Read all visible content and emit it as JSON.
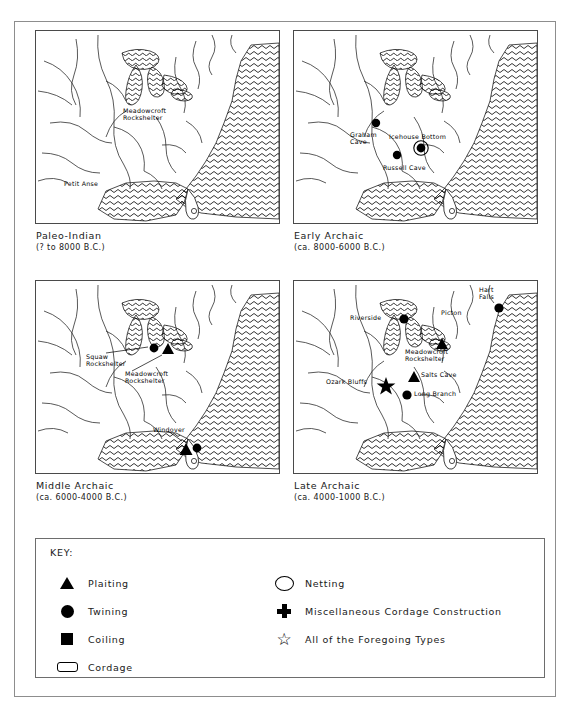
{
  "figure": {
    "panels": [
      {
        "id": "paleo-indian",
        "title": "Paleo-Indian",
        "date": "(? to 8000 B.C.)",
        "sites": [
          {
            "name": "Meadowcroft\nRockshelter",
            "symbol": "triangle",
            "label_x": 88,
            "label_y": 77,
            "marker_x": 126,
            "marker_y": 62
          },
          {
            "name": "Petit Anse",
            "symbol": "triangle",
            "label_x": 29,
            "label_y": 150,
            "marker_x": 93,
            "marker_y": 152
          }
        ]
      },
      {
        "id": "early-archaic",
        "title": "Early Archaic",
        "date": "(ca. 8000-6000 B.C.)",
        "sites": [
          {
            "name": "Graham\nCave",
            "symbol": "circle",
            "label_x": 57,
            "label_y": 101,
            "marker_x": 82,
            "marker_y": 92
          },
          {
            "name": "Icehouse Bottom",
            "symbol": "circle-in-circle",
            "label_x": 96,
            "label_y": 103,
            "marker_x": 127,
            "marker_y": 117
          },
          {
            "name": "Russell Cave",
            "symbol": "circle",
            "label_x": 90,
            "label_y": 134,
            "marker_x": 103,
            "marker_y": 124
          }
        ]
      },
      {
        "id": "middle-archaic",
        "title": "Middle Archaic",
        "date": "(ca. 6000-4000 B.C.)",
        "sites": [
          {
            "name": "Squaw\nRockshelter",
            "symbol": "circle",
            "label_x": 51,
            "label_y": 73,
            "marker_x": 118,
            "marker_y": 67
          },
          {
            "name": "Meadowcroft\nRockshelter",
            "symbol": "triangle",
            "label_x": 90,
            "label_y": 90,
            "marker_x": 132,
            "marker_y": 70
          },
          {
            "name": "Windover",
            "symbol": "triangle-circle",
            "label_x": 122,
            "label_y": 148,
            "marker_x": 155,
            "marker_y": 166
          }
        ]
      },
      {
        "id": "late-archaic",
        "title": "Late Archaic",
        "date": "(ca. 4000-1000 B.C.)",
        "sites": [
          {
            "name": "Riverside",
            "symbol": "circle",
            "label_x": 60,
            "label_y": 36,
            "marker_x": 110,
            "marker_y": 38
          },
          {
            "name": "Picton",
            "symbol": "none",
            "label_x": 150,
            "label_y": 31,
            "marker_x": 0,
            "marker_y": 0
          },
          {
            "name": "Hart\nFalls",
            "symbol": "circle",
            "label_x": 184,
            "label_y": 8,
            "marker_x": 205,
            "marker_y": 27
          },
          {
            "name": "Meadowcroft\nRockshelter",
            "symbol": "triangle",
            "label_x": 120,
            "label_y": 71,
            "marker_x": 148,
            "marker_y": 63
          },
          {
            "name": "Salts Cave",
            "symbol": "triangle",
            "label_x": 127,
            "label_y": 96,
            "marker_x": 120,
            "marker_y": 96
          },
          {
            "name": "Ozark Bluffs",
            "symbol": "star",
            "label_x": 33,
            "label_y": 103,
            "marker_x": 92,
            "marker_y": 103
          },
          {
            "name": "Long Branch",
            "symbol": "circle",
            "label_x": 122,
            "label_y": 114,
            "marker_x": 113,
            "marker_y": 114
          }
        ]
      }
    ]
  },
  "key": {
    "title": "KEY:",
    "left_items": [
      {
        "symbol": "triangle",
        "label": "Plaiting"
      },
      {
        "symbol": "circle",
        "label": "Twining"
      },
      {
        "symbol": "square",
        "label": "Coiling"
      },
      {
        "symbol": "cordage",
        "label": "Cordage"
      }
    ],
    "right_items": [
      {
        "symbol": "open-ellipse",
        "label": "Netting"
      },
      {
        "symbol": "cross",
        "label": "Miscellaneous Cordage Construction"
      },
      {
        "symbol": "star",
        "label": "All of the Foregoing Types"
      }
    ],
    "star_glyph": "☆"
  },
  "colors": {
    "ink": "#000000",
    "frame": "#8d8d8d",
    "map_border": "#4a4a4a",
    "background": "#ffffff"
  }
}
